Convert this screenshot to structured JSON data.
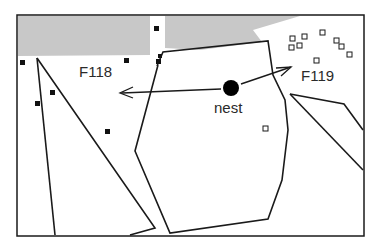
{
  "figure": {
    "labels": {
      "f118": "F118",
      "f119": "F119",
      "nest": "nest"
    },
    "colors": {
      "line": "#1a1a1a",
      "shade": "#c8c8c8",
      "text": "#2a2a2a",
      "background": "#ffffff"
    },
    "legend_markers": {
      "filled_square": "F118 locations",
      "open_square": "F119 locations"
    }
  }
}
